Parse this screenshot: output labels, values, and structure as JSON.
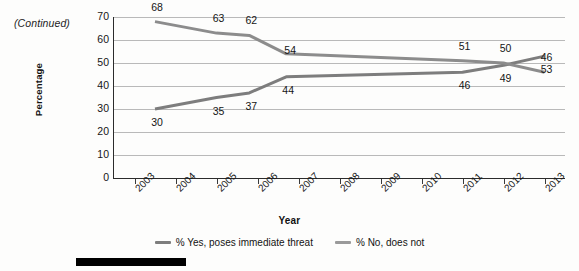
{
  "note": "(Continued)",
  "chart_data": {
    "type": "line",
    "title": "",
    "xlabel": "Year",
    "ylabel": "Percentage",
    "ylim": [
      0,
      70
    ],
    "ytick_step": 10,
    "yticks": [
      "70",
      "60",
      "50",
      "40",
      "30",
      "20",
      "10",
      "0"
    ],
    "xlim": [
      2002.5,
      2013.5
    ],
    "categories": [
      "2003",
      "2004",
      "2005",
      "2006",
      "2007",
      "2008",
      "2009",
      "2010",
      "2011",
      "2012",
      "2013"
    ],
    "grid": true,
    "legend_position": "bottom",
    "series": [
      {
        "name": "% Yes, poses immediate threat",
        "color": "#7d7d7d",
        "x": [
          2003.5,
          2005.0,
          2005.8,
          2006.7,
          2011.0,
          2012.0,
          2013.0
        ],
        "values": [
          30,
          35,
          37,
          44,
          46,
          49,
          53
        ],
        "labels": [
          "30",
          "35",
          "37",
          "44",
          "46",
          "49",
          "53"
        ]
      },
      {
        "name": "% No, does not",
        "color": "#8c8c8c",
        "x": [
          2003.5,
          2005.0,
          2005.8,
          2006.7,
          2011.0,
          2012.0,
          2013.0
        ],
        "values": [
          68,
          63,
          62,
          54,
          51,
          50,
          46
        ],
        "labels": [
          "68",
          "63",
          "62",
          "54",
          "51",
          "50",
          "46"
        ]
      }
    ]
  },
  "legend": [
    {
      "label": "% Yes, poses immediate threat",
      "color": "#7d7d7d"
    },
    {
      "label": "% No, does not",
      "color": "#9a9a9a"
    }
  ]
}
